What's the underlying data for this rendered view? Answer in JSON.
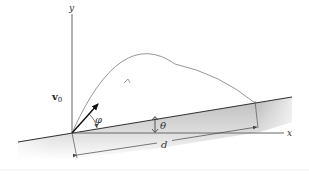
{
  "diagram": {
    "labels": {
      "y_axis": "y",
      "x_axis": "x",
      "velocity": "v",
      "velocity_subscript": "0",
      "launch_angle": "φ",
      "incline_angle": "θ",
      "distance": "d"
    },
    "colors": {
      "axis": "#555555",
      "incline_edge": "#333333",
      "ground_fill_top": "#c8c8c8",
      "ground_fill_bottom": "#ffffff",
      "trajectory": "#8a8a8a",
      "vector": "#111111",
      "dimension": "#444444"
    }
  }
}
